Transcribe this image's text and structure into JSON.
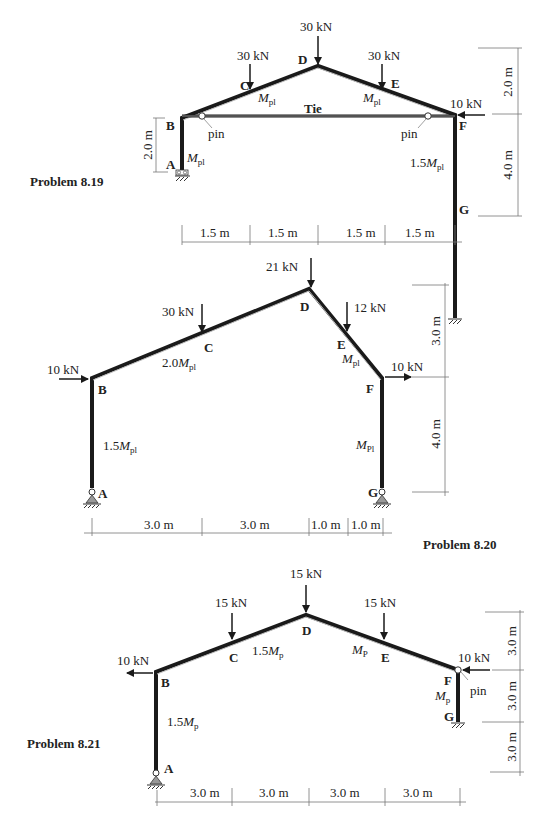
{
  "problems": [
    {
      "id": "p819",
      "title": "Problem 8.19",
      "nodes": {
        "A": "A",
        "B": "B",
        "C": "C",
        "D": "D",
        "E": "E",
        "F": "F",
        "G": "G"
      },
      "loads": {
        "D": "30 kN",
        "C": "30 kN",
        "E": "30 kN",
        "F": "10 kN"
      },
      "members": {
        "AB": {
          "M": "M",
          "sub": "pl",
          "prefix": ""
        },
        "BD_left": {
          "M": "M",
          "sub": "pl",
          "prefix": ""
        },
        "DF_right": {
          "M": "M",
          "sub": "pl",
          "prefix": ""
        },
        "FG": {
          "M": "M",
          "sub": "pl",
          "prefix": "1.5"
        }
      },
      "tie_label": "Tie",
      "pin_left": "pin",
      "pin_right": "pin",
      "horizontal_dims": [
        "1.5 m",
        "1.5 m",
        "1.5 m",
        "1.5 m"
      ],
      "vertical_dims_right": [
        "2.0 m",
        "4.0 m"
      ],
      "vertical_dim_left": "2.0 m"
    },
    {
      "id": "p820",
      "title": "Problem 8.20",
      "nodes": {
        "A": "A",
        "B": "B",
        "C": "C",
        "D": "D",
        "E": "E",
        "F": "F",
        "G": "G"
      },
      "loads": {
        "D": "21 kN",
        "C": "30 kN",
        "E": "12 kN",
        "B": "10 kN",
        "F": "10 kN"
      },
      "members": {
        "AB": {
          "M": "M",
          "sub": "pl",
          "prefix": "1.5"
        },
        "BD": {
          "M": "M",
          "sub": "pl",
          "prefix": "2.0"
        },
        "DF": {
          "M": "M",
          "sub": "pl",
          "prefix": ""
        },
        "FG": {
          "M": "M",
          "sub": "Pl",
          "prefix": ""
        }
      },
      "horizontal_dims": [
        "3.0 m",
        "3.0 m",
        "1.0 m",
        "1.0 m"
      ],
      "vertical_dims_right": [
        "3.0 m",
        "4.0 m"
      ]
    },
    {
      "id": "p821",
      "title": "Problem 8.21",
      "nodes": {
        "A": "A",
        "B": "B",
        "C": "C",
        "D": "D",
        "E": "E",
        "F": "F",
        "G": "G"
      },
      "loads": {
        "D": "15 kN",
        "C": "15 kN",
        "E": "15 kN",
        "B": "10 kN",
        "F": "10 kN"
      },
      "members": {
        "AB": {
          "M": "M",
          "sub": "p",
          "prefix": "1.5"
        },
        "BD": {
          "M": "M",
          "sub": "p",
          "prefix": "1.5"
        },
        "DF": {
          "M": "M",
          "sub": "P",
          "prefix": ""
        },
        "FG": {
          "M": "M",
          "sub": "p",
          "prefix": ""
        }
      },
      "pin_label": "pin",
      "horizontal_dims": [
        "3.0 m",
        "3.0 m",
        "3.0 m",
        "3.0 m"
      ],
      "vertical_dims_right": [
        "3.0 m",
        "3.0 m",
        "3.0 m"
      ]
    }
  ]
}
